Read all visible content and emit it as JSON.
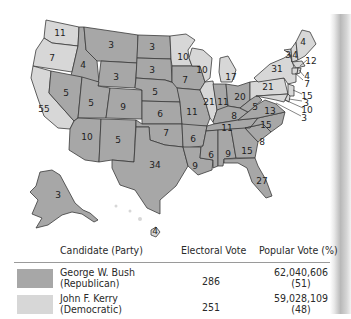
{
  "map": {
    "title": "2004 U.S. Presidential Election Electoral Votes by State",
    "colors": {
      "republican": "#a7a7a7",
      "democratic": "#d7d7d7",
      "border": "#3a3a3a"
    },
    "states": [
      {
        "name": "Washington",
        "ev": 11,
        "party": "democratic"
      },
      {
        "name": "Oregon",
        "ev": 7,
        "party": "democratic"
      },
      {
        "name": "California",
        "ev": 55,
        "party": "democratic"
      },
      {
        "name": "Idaho",
        "ev": 4,
        "party": "republican"
      },
      {
        "name": "Nevada",
        "ev": 5,
        "party": "republican"
      },
      {
        "name": "Montana",
        "ev": 3,
        "party": "republican"
      },
      {
        "name": "Wyoming",
        "ev": 3,
        "party": "republican"
      },
      {
        "name": "Utah",
        "ev": 5,
        "party": "republican"
      },
      {
        "name": "Arizona",
        "ev": 10,
        "party": "republican"
      },
      {
        "name": "Colorado",
        "ev": 9,
        "party": "republican"
      },
      {
        "name": "New Mexico",
        "ev": 5,
        "party": "republican"
      },
      {
        "name": "North Dakota",
        "ev": 3,
        "party": "republican"
      },
      {
        "name": "South Dakota",
        "ev": 3,
        "party": "republican"
      },
      {
        "name": "Nebraska",
        "ev": 5,
        "party": "republican"
      },
      {
        "name": "Kansas",
        "ev": 6,
        "party": "republican"
      },
      {
        "name": "Oklahoma",
        "ev": 7,
        "party": "republican"
      },
      {
        "name": "Texas",
        "ev": 34,
        "party": "republican"
      },
      {
        "name": "Minnesota",
        "ev": 10,
        "party": "democratic"
      },
      {
        "name": "Iowa",
        "ev": 7,
        "party": "republican"
      },
      {
        "name": "Missouri",
        "ev": 11,
        "party": "republican"
      },
      {
        "name": "Arkansas",
        "ev": 6,
        "party": "republican"
      },
      {
        "name": "Louisiana",
        "ev": 9,
        "party": "republican"
      },
      {
        "name": "Wisconsin",
        "ev": 10,
        "party": "democratic"
      },
      {
        "name": "Illinois",
        "ev": 21,
        "party": "democratic"
      },
      {
        "name": "Michigan",
        "ev": 17,
        "party": "democratic"
      },
      {
        "name": "Indiana",
        "ev": 11,
        "party": "republican"
      },
      {
        "name": "Ohio",
        "ev": 20,
        "party": "republican"
      },
      {
        "name": "Kentucky",
        "ev": 8,
        "party": "republican"
      },
      {
        "name": "Tennessee",
        "ev": 11,
        "party": "republican"
      },
      {
        "name": "Mississippi",
        "ev": 6,
        "party": "republican"
      },
      {
        "name": "Alabama",
        "ev": 9,
        "party": "republican"
      },
      {
        "name": "Georgia",
        "ev": 15,
        "party": "republican"
      },
      {
        "name": "Florida",
        "ev": 27,
        "party": "republican"
      },
      {
        "name": "South Carolina",
        "ev": 8,
        "party": "republican"
      },
      {
        "name": "North Carolina",
        "ev": 15,
        "party": "republican"
      },
      {
        "name": "Virginia",
        "ev": 13,
        "party": "republican"
      },
      {
        "name": "West Virginia",
        "ev": 5,
        "party": "republican"
      },
      {
        "name": "Pennsylvania",
        "ev": 21,
        "party": "democratic"
      },
      {
        "name": "New York",
        "ev": 31,
        "party": "democratic"
      },
      {
        "name": "Vermont",
        "ev": 3,
        "party": "democratic"
      },
      {
        "name": "New Hampshire",
        "ev": 4,
        "party": "democratic"
      },
      {
        "name": "Maine",
        "ev": 4,
        "party": "democratic"
      },
      {
        "name": "Massachusetts",
        "ev": 12,
        "party": "democratic"
      },
      {
        "name": "Rhode Island",
        "ev": 4,
        "party": "democratic"
      },
      {
        "name": "Connecticut",
        "ev": 7,
        "party": "democratic"
      },
      {
        "name": "New Jersey",
        "ev": 15,
        "party": "democratic"
      },
      {
        "name": "Delaware",
        "ev": 3,
        "party": "democratic"
      },
      {
        "name": "Maryland",
        "ev": 10,
        "party": "democratic"
      },
      {
        "name": "District of Columbia",
        "ev": 3,
        "party": "democratic"
      },
      {
        "name": "Alaska",
        "ev": 3,
        "party": "republican"
      },
      {
        "name": "Hawaii",
        "ev": 4,
        "party": "democratic"
      }
    ],
    "labels": {
      "WA": "11",
      "OR": "7",
      "CA": "55",
      "ID": "4",
      "NV": "5",
      "MT": "3",
      "WY": "3",
      "UT": "5",
      "AZ": "10",
      "CO": "9",
      "NM": "5",
      "ND": "3",
      "SD": "3",
      "NE": "5",
      "KS": "6",
      "OK": "7",
      "TX": "34",
      "MN": "10",
      "IA": "7",
      "MO": "11",
      "AR": "6",
      "LA": "9",
      "WI": "10",
      "IL": "21",
      "MI": "17",
      "IN": "11",
      "OH": "20",
      "KY": "8",
      "TN": "11",
      "MS": "6",
      "AL": "9",
      "GA": "15",
      "FL": "27",
      "SC": "8",
      "NC": "15",
      "VA": "13",
      "WV": "5",
      "PA": "21",
      "NY": "31",
      "VT": "3",
      "NH": "4",
      "ME": "4",
      "MA": "12",
      "RI": "4",
      "CT": "7",
      "NJ": "15",
      "DE": "3",
      "MD": "10",
      "DC": "3",
      "AK": "3",
      "HI": "4"
    }
  },
  "legend": {
    "headers": {
      "candidate": "Candidate (Party)",
      "electoral": "Electoral Vote",
      "popular": "Popular Vote (%)"
    },
    "rows": [
      {
        "name": "George W. Bush",
        "party": "(Republican)",
        "electoral_vote": "286",
        "popular_vote": "62,040,606",
        "popular_pct": "(51)",
        "color": "#a7a7a7"
      },
      {
        "name": "John F. Kerry",
        "party": "(Democratic)",
        "electoral_vote": "251",
        "popular_vote": "59,028,109",
        "popular_pct": "(48)",
        "color": "#d7d7d7"
      }
    ]
  }
}
